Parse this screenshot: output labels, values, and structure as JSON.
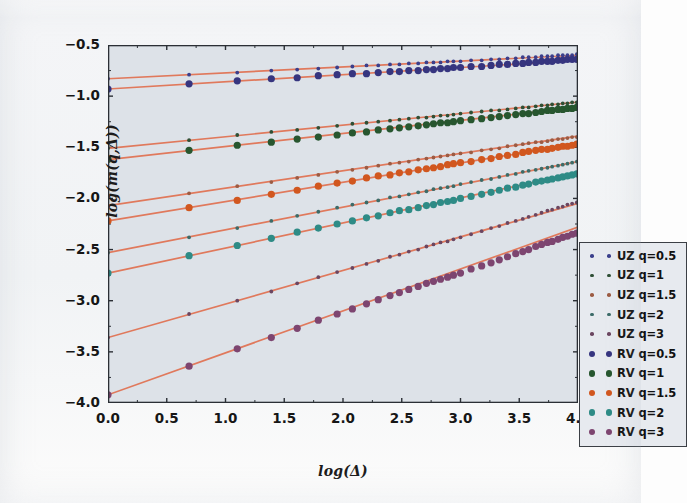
{
  "figure": {
    "background_color": "#f2f4f6",
    "plot_background_color": "#dde2e8",
    "axis_color": "#2b2f35"
  },
  "axes": {
    "xlabel": "log(Δ)",
    "ylabel": "log(m(q,Δ))",
    "xticks": [
      "0.0",
      "0.5",
      "1.0",
      "1.5",
      "2.0",
      "2.5",
      "3.0",
      "3.5",
      "4.0"
    ],
    "yticks": [
      "−0.5",
      "−1.0",
      "−1.5",
      "−2.0",
      "−2.5",
      "−3.0",
      "−3.5",
      "−4.0"
    ]
  },
  "legend": {
    "entries": [
      {
        "label": "UZ q=0.5",
        "color": "#3b3f8c",
        "size": "small"
      },
      {
        "label": "UZ q=1",
        "color": "#2f4f35",
        "size": "small"
      },
      {
        "label": "UZ q=1.5",
        "color": "#9c5b43",
        "size": "small"
      },
      {
        "label": "UZ q=2",
        "color": "#3c6b68",
        "size": "small"
      },
      {
        "label": "UZ q=3",
        "color": "#6b4660",
        "size": "small"
      },
      {
        "label": "RV q=0.5",
        "color": "#36357f",
        "size": "large"
      },
      {
        "label": "RV q=1",
        "color": "#27562f",
        "size": "large"
      },
      {
        "label": "RV q=1.5",
        "color": "#d1571f",
        "size": "large"
      },
      {
        "label": "RV q=2",
        "color": "#2e8b86",
        "size": "large"
      },
      {
        "label": "RV q=3",
        "color": "#7d4570",
        "size": "large"
      }
    ]
  },
  "chart_data": {
    "type": "scatter",
    "title": "",
    "xlabel": "log(Δ)",
    "ylabel": "log(m(q,Δ))",
    "xlim": [
      0.0,
      4.0
    ],
    "ylim": [
      -4.0,
      -0.5
    ],
    "grid": false,
    "legend_position": "lower right",
    "fit_line_color": "#e0795c",
    "series": [
      {
        "name": "UZ q=0.5",
        "estimator": "UZ",
        "q": 0.5,
        "color": "#3b3f8c",
        "marker_size": "small",
        "fit": {
          "intercept": -0.83,
          "slope": 0.0575
        },
        "x": [
          0.0,
          0.69,
          1.1,
          1.39,
          1.61,
          1.79,
          1.95,
          2.08,
          2.2,
          2.3,
          2.4,
          2.48,
          2.56,
          2.64,
          2.71,
          2.77,
          2.83,
          2.89,
          2.94,
          3.0,
          3.09,
          3.18,
          3.26,
          3.33,
          3.4,
          3.47,
          3.53,
          3.58,
          3.64,
          3.69,
          3.74,
          3.78,
          3.83,
          3.87,
          3.91,
          3.95,
          3.99
        ],
        "y": [
          -0.83,
          -0.79,
          -0.77,
          -0.75,
          -0.74,
          -0.73,
          -0.72,
          -0.71,
          -0.7,
          -0.7,
          -0.69,
          -0.69,
          -0.68,
          -0.68,
          -0.67,
          -0.67,
          -0.67,
          -0.66,
          -0.66,
          -0.66,
          -0.65,
          -0.65,
          -0.64,
          -0.64,
          -0.63,
          -0.63,
          -0.62,
          -0.62,
          -0.62,
          -0.61,
          -0.61,
          -0.61,
          -0.6,
          -0.6,
          -0.6,
          -0.6,
          -0.59
        ]
      },
      {
        "name": "RV q=0.5",
        "estimator": "RV",
        "q": 0.5,
        "color": "#36357f",
        "marker_size": "large",
        "fit": {
          "intercept": -0.93,
          "slope": 0.07
        },
        "x": [
          0.0,
          0.69,
          1.1,
          1.39,
          1.61,
          1.79,
          1.95,
          2.08,
          2.2,
          2.3,
          2.4,
          2.48,
          2.56,
          2.64,
          2.71,
          2.77,
          2.83,
          2.89,
          2.94,
          3.0,
          3.09,
          3.18,
          3.26,
          3.33,
          3.4,
          3.47,
          3.53,
          3.58,
          3.64,
          3.69,
          3.74,
          3.78,
          3.83,
          3.87,
          3.91,
          3.95,
          3.99
        ],
        "y": [
          -0.93,
          -0.88,
          -0.85,
          -0.83,
          -0.82,
          -0.8,
          -0.79,
          -0.78,
          -0.78,
          -0.77,
          -0.76,
          -0.76,
          -0.75,
          -0.75,
          -0.74,
          -0.74,
          -0.73,
          -0.73,
          -0.72,
          -0.72,
          -0.71,
          -0.71,
          -0.7,
          -0.69,
          -0.69,
          -0.68,
          -0.68,
          -0.67,
          -0.67,
          -0.66,
          -0.66,
          -0.66,
          -0.65,
          -0.65,
          -0.64,
          -0.64,
          -0.64
        ]
      },
      {
        "name": "UZ q=1",
        "estimator": "UZ",
        "q": 1,
        "color": "#2f4f35",
        "marker_size": "small",
        "fit": {
          "intercept": -1.51,
          "slope": 0.113
        },
        "x": [
          0.0,
          0.69,
          1.1,
          1.39,
          1.61,
          1.79,
          1.95,
          2.08,
          2.2,
          2.3,
          2.4,
          2.48,
          2.56,
          2.64,
          2.71,
          2.77,
          2.83,
          2.89,
          2.94,
          3.0,
          3.09,
          3.18,
          3.26,
          3.33,
          3.4,
          3.47,
          3.53,
          3.58,
          3.64,
          3.69,
          3.74,
          3.78,
          3.83,
          3.87,
          3.91,
          3.95,
          3.99
        ],
        "y": [
          -1.51,
          -1.43,
          -1.38,
          -1.35,
          -1.33,
          -1.31,
          -1.29,
          -1.27,
          -1.26,
          -1.25,
          -1.24,
          -1.23,
          -1.22,
          -1.21,
          -1.21,
          -1.2,
          -1.19,
          -1.19,
          -1.18,
          -1.17,
          -1.16,
          -1.15,
          -1.14,
          -1.14,
          -1.13,
          -1.12,
          -1.11,
          -1.11,
          -1.1,
          -1.09,
          -1.09,
          -1.08,
          -1.08,
          -1.07,
          -1.07,
          -1.06,
          -1.06
        ]
      },
      {
        "name": "RV q=1",
        "estimator": "RV",
        "q": 1,
        "color": "#27562f",
        "marker_size": "large",
        "fit": {
          "intercept": -1.62,
          "slope": 0.1275
        },
        "x": [
          0.0,
          0.69,
          1.1,
          1.39,
          1.61,
          1.79,
          1.95,
          2.08,
          2.2,
          2.3,
          2.4,
          2.48,
          2.56,
          2.64,
          2.71,
          2.77,
          2.83,
          2.89,
          2.94,
          3.0,
          3.09,
          3.18,
          3.26,
          3.33,
          3.4,
          3.47,
          3.53,
          3.58,
          3.64,
          3.69,
          3.74,
          3.78,
          3.83,
          3.87,
          3.91,
          3.95,
          3.99
        ],
        "y": [
          -1.62,
          -1.53,
          -1.48,
          -1.45,
          -1.42,
          -1.4,
          -1.38,
          -1.36,
          -1.35,
          -1.33,
          -1.32,
          -1.31,
          -1.3,
          -1.29,
          -1.28,
          -1.27,
          -1.26,
          -1.26,
          -1.25,
          -1.24,
          -1.23,
          -1.22,
          -1.21,
          -1.2,
          -1.19,
          -1.18,
          -1.17,
          -1.17,
          -1.16,
          -1.15,
          -1.14,
          -1.14,
          -1.13,
          -1.13,
          -1.12,
          -1.12,
          -1.11
        ]
      },
      {
        "name": "UZ q=1.5",
        "estimator": "UZ",
        "q": 1.5,
        "color": "#9c5b43",
        "marker_size": "small",
        "fit": {
          "intercept": -2.07,
          "slope": 0.17
        },
        "x": [
          0.0,
          0.69,
          1.1,
          1.39,
          1.61,
          1.79,
          1.95,
          2.08,
          2.2,
          2.3,
          2.4,
          2.48,
          2.56,
          2.64,
          2.71,
          2.77,
          2.83,
          2.89,
          2.94,
          3.0,
          3.09,
          3.18,
          3.26,
          3.33,
          3.4,
          3.47,
          3.53,
          3.58,
          3.64,
          3.69,
          3.74,
          3.78,
          3.83,
          3.87,
          3.91,
          3.95,
          3.99
        ],
        "y": [
          -2.07,
          -1.95,
          -1.88,
          -1.84,
          -1.8,
          -1.77,
          -1.74,
          -1.72,
          -1.7,
          -1.68,
          -1.66,
          -1.65,
          -1.64,
          -1.62,
          -1.61,
          -1.6,
          -1.59,
          -1.58,
          -1.57,
          -1.56,
          -1.55,
          -1.53,
          -1.52,
          -1.51,
          -1.49,
          -1.48,
          -1.47,
          -1.46,
          -1.45,
          -1.45,
          -1.44,
          -1.43,
          -1.42,
          -1.42,
          -1.41,
          -1.4,
          -1.4
        ]
      },
      {
        "name": "RV q=1.5",
        "estimator": "RV",
        "q": 1.5,
        "color": "#d1571f",
        "marker_size": "large",
        "fit": {
          "intercept": -2.22,
          "slope": 0.1885
        },
        "x": [
          0.0,
          0.69,
          1.1,
          1.39,
          1.61,
          1.79,
          1.95,
          2.08,
          2.2,
          2.3,
          2.4,
          2.48,
          2.56,
          2.64,
          2.71,
          2.77,
          2.83,
          2.89,
          2.94,
          3.0,
          3.09,
          3.18,
          3.26,
          3.33,
          3.4,
          3.47,
          3.53,
          3.58,
          3.64,
          3.69,
          3.74,
          3.78,
          3.83,
          3.87,
          3.91,
          3.95,
          3.99
        ],
        "y": [
          -2.22,
          -2.09,
          -2.02,
          -1.96,
          -1.92,
          -1.88,
          -1.85,
          -1.83,
          -1.8,
          -1.78,
          -1.77,
          -1.75,
          -1.74,
          -1.72,
          -1.71,
          -1.7,
          -1.69,
          -1.67,
          -1.66,
          -1.65,
          -1.64,
          -1.62,
          -1.61,
          -1.59,
          -1.58,
          -1.57,
          -1.55,
          -1.54,
          -1.53,
          -1.52,
          -1.52,
          -1.51,
          -1.5,
          -1.49,
          -1.49,
          -1.48,
          -1.47
        ]
      },
      {
        "name": "UZ q=2",
        "estimator": "UZ",
        "q": 2,
        "color": "#3c6b68",
        "marker_size": "small",
        "fit": {
          "intercept": -2.53,
          "slope": 0.2225
        },
        "x": [
          0.0,
          0.69,
          1.1,
          1.39,
          1.61,
          1.79,
          1.95,
          2.08,
          2.2,
          2.3,
          2.4,
          2.48,
          2.56,
          2.64,
          2.71,
          2.77,
          2.83,
          2.89,
          2.94,
          3.0,
          3.09,
          3.18,
          3.26,
          3.33,
          3.4,
          3.47,
          3.53,
          3.58,
          3.64,
          3.69,
          3.74,
          3.78,
          3.83,
          3.87,
          3.91,
          3.95,
          3.99
        ],
        "y": [
          -2.53,
          -2.38,
          -2.29,
          -2.22,
          -2.17,
          -2.13,
          -2.09,
          -2.06,
          -2.04,
          -2.02,
          -1.99,
          -1.98,
          -1.96,
          -1.94,
          -1.93,
          -1.91,
          -1.9,
          -1.89,
          -1.88,
          -1.86,
          -1.84,
          -1.82,
          -1.81,
          -1.79,
          -1.77,
          -1.76,
          -1.74,
          -1.73,
          -1.72,
          -1.71,
          -1.7,
          -1.69,
          -1.68,
          -1.67,
          -1.66,
          -1.65,
          -1.64
        ]
      },
      {
        "name": "RV q=2",
        "estimator": "RV",
        "q": 2,
        "color": "#2e8b86",
        "marker_size": "large",
        "fit": {
          "intercept": -2.73,
          "slope": 0.245
        },
        "x": [
          0.0,
          0.69,
          1.1,
          1.39,
          1.61,
          1.79,
          1.95,
          2.08,
          2.2,
          2.3,
          2.4,
          2.48,
          2.56,
          2.64,
          2.71,
          2.77,
          2.83,
          2.89,
          2.94,
          3.0,
          3.09,
          3.18,
          3.26,
          3.33,
          3.4,
          3.47,
          3.53,
          3.58,
          3.64,
          3.69,
          3.74,
          3.78,
          3.83,
          3.87,
          3.91,
          3.95,
          3.99
        ],
        "y": [
          -2.73,
          -2.56,
          -2.46,
          -2.39,
          -2.33,
          -2.29,
          -2.25,
          -2.22,
          -2.19,
          -2.17,
          -2.14,
          -2.12,
          -2.11,
          -2.09,
          -2.07,
          -2.06,
          -2.04,
          -2.03,
          -2.02,
          -2.0,
          -1.98,
          -1.96,
          -1.94,
          -1.92,
          -1.9,
          -1.89,
          -1.87,
          -1.86,
          -1.84,
          -1.83,
          -1.82,
          -1.81,
          -1.8,
          -1.79,
          -1.78,
          -1.77,
          -1.76
        ]
      },
      {
        "name": "UZ q=3",
        "estimator": "UZ",
        "q": 3,
        "color": "#6b4660",
        "marker_size": "small",
        "fit": {
          "intercept": -3.36,
          "slope": 0.328
        },
        "x": [
          0.0,
          0.69,
          1.1,
          1.39,
          1.61,
          1.79,
          1.95,
          2.08,
          2.2,
          2.3,
          2.4,
          2.48,
          2.56,
          2.64,
          2.71,
          2.77,
          2.83,
          2.89,
          2.94,
          3.0,
          3.09,
          3.18,
          3.26,
          3.33,
          3.4,
          3.47,
          3.53,
          3.58,
          3.64,
          3.69,
          3.74,
          3.78,
          3.83,
          3.87,
          3.91,
          3.95,
          3.99
        ],
        "y": [
          -3.36,
          -3.13,
          -3.0,
          -2.91,
          -2.83,
          -2.77,
          -2.72,
          -2.68,
          -2.64,
          -2.61,
          -2.57,
          -2.55,
          -2.52,
          -2.5,
          -2.47,
          -2.45,
          -2.43,
          -2.42,
          -2.4,
          -2.38,
          -2.35,
          -2.32,
          -2.29,
          -2.27,
          -2.24,
          -2.22,
          -2.2,
          -2.18,
          -2.16,
          -2.14,
          -2.12,
          -2.11,
          -2.09,
          -2.08,
          -2.06,
          -2.05,
          -2.04
        ]
      },
      {
        "name": "RV q=3",
        "estimator": "RV",
        "q": 3,
        "color": "#7d4570",
        "marker_size": "large",
        "fit": {
          "intercept": -3.92,
          "slope": 0.41
        },
        "x": [
          0.0,
          0.69,
          1.1,
          1.39,
          1.61,
          1.79,
          1.95,
          2.08,
          2.2,
          2.3,
          2.4,
          2.48,
          2.56,
          2.64,
          2.71,
          2.77,
          2.83,
          2.89,
          2.94,
          3.0,
          3.09,
          3.18,
          3.26,
          3.33,
          3.4,
          3.47,
          3.53,
          3.58,
          3.64,
          3.69,
          3.74,
          3.78,
          3.83,
          3.87,
          3.91,
          3.95,
          3.99
        ],
        "y": [
          -3.92,
          -3.64,
          -3.47,
          -3.36,
          -3.27,
          -3.19,
          -3.13,
          -3.08,
          -3.03,
          -2.99,
          -2.95,
          -2.92,
          -2.89,
          -2.86,
          -2.83,
          -2.81,
          -2.79,
          -2.77,
          -2.75,
          -2.73,
          -2.69,
          -2.66,
          -2.63,
          -2.6,
          -2.57,
          -2.54,
          -2.52,
          -2.5,
          -2.47,
          -2.45,
          -2.43,
          -2.42,
          -2.4,
          -2.38,
          -2.37,
          -2.35,
          -2.34
        ]
      }
    ]
  }
}
